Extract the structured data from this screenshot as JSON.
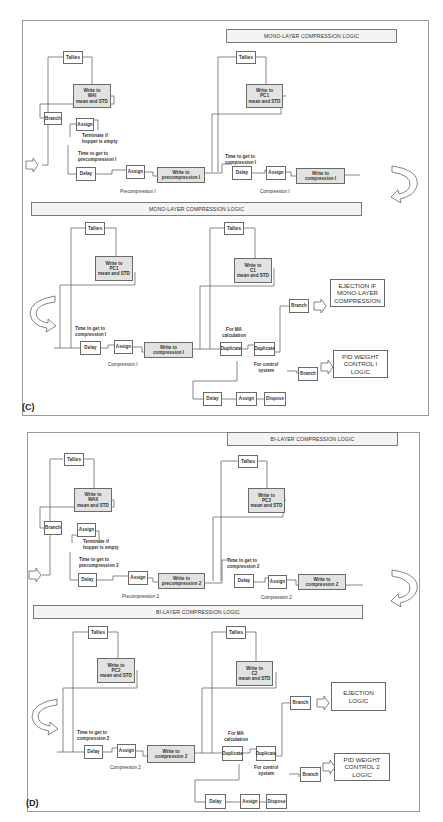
{
  "panels": {
    "C": {
      "tag": "(C)",
      "top_title": "MONO-LAYER COMPRESSION LOGIC",
      "mid_title": "MONO-LAYER COMPRESSION LOGIC",
      "upper": {
        "tallies_1": "Tallies",
        "write_wai": "Write to\nWAI\nmean and STD",
        "branch": "Branch",
        "assign_term": "Assign",
        "terminate_label": "Terminate if\nhopper is empty",
        "time_pre_label": "Time to get to\nprecompression I",
        "delay_pre": "Delay",
        "assign_pre": "Assign",
        "write_pre": "Write to\nprecompression I",
        "pre_caption": "Precompression I",
        "tallies_2": "Tallies",
        "write_pc": "Write to\nPC1\nmean and STD",
        "time_comp_label": "Time to get to\ncompression I",
        "delay_comp": "Delay",
        "assign_comp": "Assign",
        "write_comp": "Write to\ncompression I",
        "comp_caption": "Compression I"
      },
      "lower": {
        "tallies_1": "Tallies",
        "write_pc": "Write to\nPC1\nmean and STD",
        "time_comp_label": "Time to get to\ncompression I",
        "delay": "Delay",
        "assign": "Assign",
        "write_comp": "Write to\ncompression I",
        "comp_caption": "Compression I",
        "tallies_2": "Tallies",
        "write_c": "Write to\nC1\nmean and STD",
        "ma_label": "For MA\ncalculation",
        "duplicate_1": "Duplicate",
        "duplicate_2": "Duplicate",
        "branch_eject": "Branch",
        "eject_box": "EJECTION IF\nMONO-LAYER\nCOMPRESSION",
        "control_label": "For control\nsystem",
        "branch_pid": "Branch",
        "pid_box": "PID WEIGHT\nCONTROL I LOGIC",
        "delay_2": "Delay",
        "assign_2": "Assign",
        "dispose": "Dispose"
      }
    },
    "D": {
      "tag": "(D)",
      "top_title": "BI-LAYER COMPRESSION LOGIC",
      "mid_title": "BI-LAYER COMPRESSION LOGIC",
      "upper": {
        "tallies_1": "Tallies",
        "write_wai": "Write to\nWAII\nmean and STD",
        "branch": "Branch",
        "assign_term": "Assign",
        "terminate_label": "Terminate if\nhopper is empty",
        "time_pre_label": "Time to get to\nprecompression 2",
        "delay_pre": "Delay",
        "assign_pre": "Assign",
        "write_pre": "Write to\nprecompression 2",
        "pre_caption": "Precompression 2",
        "tallies_2": "Tallies",
        "write_pc": "Write to\nPC2\nmean and STD",
        "time_comp_label": "Time to get to\ncompression 2",
        "delay_comp": "Delay",
        "assign_comp": "Assign",
        "write_comp": "Write to\ncompression 2",
        "comp_caption": "Compression 2"
      },
      "lower": {
        "tallies_1": "Tallies",
        "write_pc": "Write to\nPC2\nmean and STD",
        "time_comp_label": "Time to get to\ncompression 2",
        "delay": "Delay",
        "assign": "Assign",
        "write_comp": "Write to\ncompression 2",
        "comp_caption": "Compression 2",
        "tallies_2": "Tallies",
        "write_c": "Write to\nC2\nmean and STD",
        "ma_label": "For MA\ncalculation",
        "duplicate_1": "Duplicate",
        "duplicate_2": "Duplicate",
        "branch_eject": "Branch",
        "eject_box": "EJECTION\nLOGIC",
        "control_label": "For control\nsystem",
        "branch_pid": "Branch",
        "pid_box": "PID WEIGHT\nCONTROL 2  LOGIC",
        "delay_2": "Delay",
        "assign_2": "Assign",
        "dispose": "Dispose"
      }
    }
  },
  "colors": {
    "line": "#555555",
    "shaded_box": "#e2e2e2",
    "title_bar": "#f3f3f3"
  }
}
